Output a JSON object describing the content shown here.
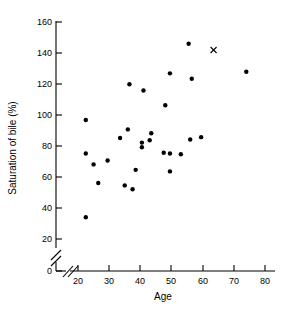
{
  "chart_data": {
    "type": "scatter",
    "title": "",
    "xlabel": "Age",
    "ylabel": "Saturation of bile (%)",
    "xlim": [
      20,
      80
    ],
    "ylim": [
      0,
      160
    ],
    "xticks": [
      20,
      30,
      40,
      50,
      60,
      70,
      80
    ],
    "yticks": [
      0,
      20,
      40,
      60,
      80,
      100,
      120,
      140,
      160
    ],
    "xticklabels": [
      "20",
      "30",
      "40",
      "50",
      "60",
      "70",
      "80"
    ],
    "yticklabels": [
      "0",
      "20",
      "40",
      "60",
      "80",
      "100",
      "120",
      "140",
      "160"
    ],
    "grid": false,
    "legend": false,
    "axis_break_x": true,
    "axis_break_y": true,
    "series": [
      {
        "name": "patients",
        "marker": "filled-circle",
        "points": [
          {
            "x": 22.5,
            "y": 97.0
          },
          {
            "x": 22.5,
            "y": 75.5
          },
          {
            "x": 22.5,
            "y": 34.5
          },
          {
            "x": 25.0,
            "y": 68.5
          },
          {
            "x": 26.5,
            "y": 56.5
          },
          {
            "x": 29.5,
            "y": 71.0
          },
          {
            "x": 33.5,
            "y": 85.5
          },
          {
            "x": 35.0,
            "y": 55.0
          },
          {
            "x": 36.0,
            "y": 91.0
          },
          {
            "x": 36.5,
            "y": 120.0
          },
          {
            "x": 37.5,
            "y": 52.5
          },
          {
            "x": 38.5,
            "y": 65.0
          },
          {
            "x": 40.5,
            "y": 82.5
          },
          {
            "x": 40.5,
            "y": 79.5
          },
          {
            "x": 41.0,
            "y": 116.0
          },
          {
            "x": 43.0,
            "y": 84.0
          },
          {
            "x": 43.5,
            "y": 88.5
          },
          {
            "x": 47.5,
            "y": 76.0
          },
          {
            "x": 48.0,
            "y": 106.5
          },
          {
            "x": 49.5,
            "y": 75.5
          },
          {
            "x": 49.5,
            "y": 64.0
          },
          {
            "x": 49.5,
            "y": 127.0
          },
          {
            "x": 53.0,
            "y": 75.0
          },
          {
            "x": 55.5,
            "y": 146.0
          },
          {
            "x": 56.0,
            "y": 84.5
          },
          {
            "x": 56.5,
            "y": 123.5
          },
          {
            "x": 59.5,
            "y": 86.0
          },
          {
            "x": 74.0,
            "y": 128.0
          }
        ]
      },
      {
        "name": "outlier-cross",
        "marker": "cross",
        "points": [
          {
            "x": 63.5,
            "y": 142.0
          }
        ]
      }
    ]
  }
}
